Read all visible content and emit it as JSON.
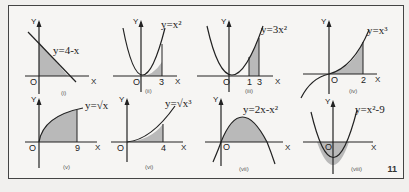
{
  "page_number": "11",
  "colors": {
    "shade": "#b9b9b9",
    "curve": "#222222",
    "frame": "#444444"
  },
  "panels": [
    {
      "id": "i",
      "roman": "(i)",
      "equation": "y=4-x",
      "origin": "O",
      "x_axis": "X",
      "y_axis": "Y",
      "ticks": []
    },
    {
      "id": "ii",
      "roman": "(ii)",
      "equation": "y=x²",
      "origin": "O",
      "x_axis": "X",
      "y_axis": "Y",
      "ticks": [
        "3"
      ]
    },
    {
      "id": "iii",
      "roman": "(iii)",
      "equation": "y=3x²",
      "origin": "O",
      "x_axis": "X",
      "y_axis": "Y",
      "ticks": [
        "1",
        "3"
      ]
    },
    {
      "id": "iv",
      "roman": "(iv)",
      "equation": "y=x³",
      "origin": "O",
      "x_axis": "X",
      "y_axis": "Y",
      "ticks": [
        "2"
      ]
    },
    {
      "id": "v",
      "roman": "(v)",
      "equation": "y=√x",
      "origin": "O",
      "x_axis": "X",
      "y_axis": "Y",
      "ticks": [
        "9"
      ]
    },
    {
      "id": "vi",
      "roman": "(vi)",
      "equation": "y=√x³",
      "origin": "O",
      "x_axis": "X",
      "y_axis": "Y",
      "ticks": [
        "4"
      ]
    },
    {
      "id": "vii",
      "roman": "(vii)",
      "equation": "y=2x-x²",
      "origin": "O",
      "x_axis": "X",
      "y_axis": "Y",
      "ticks": []
    },
    {
      "id": "viii",
      "roman": "(viii)",
      "equation": "y=x²-9",
      "origin": "O",
      "x_axis": "X",
      "y_axis": "Y",
      "ticks": []
    }
  ]
}
